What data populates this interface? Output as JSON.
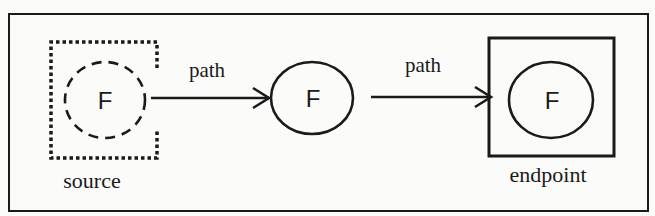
{
  "diagram": {
    "nodes": [
      {
        "id": "source",
        "letter": "F",
        "caption": "source",
        "circle_style": "dashed",
        "container_style": "dotted-square"
      },
      {
        "id": "middle",
        "letter": "F",
        "caption": "",
        "circle_style": "solid",
        "container_style": "none"
      },
      {
        "id": "endpoint",
        "letter": "F",
        "caption": "endpoint",
        "circle_style": "solid",
        "container_style": "solid-square"
      }
    ],
    "edges": [
      {
        "from": "source",
        "to": "middle",
        "label": "path"
      },
      {
        "from": "middle",
        "to": "endpoint",
        "label": "path"
      }
    ],
    "colors": {
      "stroke": "#1a1a1a",
      "background": "#fbfbf9"
    }
  }
}
